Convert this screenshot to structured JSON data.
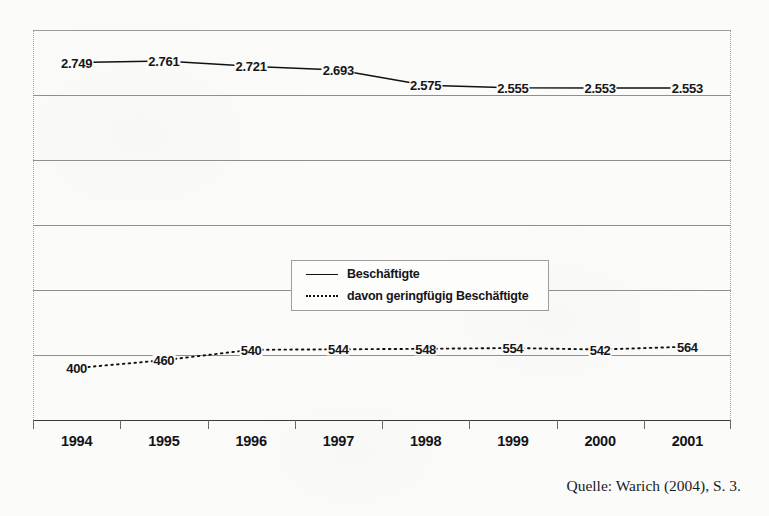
{
  "source_note": "Quelle: Warich (2004), S. 3.",
  "legend": {
    "position": "inside-center",
    "entries": [
      {
        "label": "Beschäftigte",
        "style": "solid"
      },
      {
        "label": "davon geringfügig Beschäftigte",
        "style": "dotted"
      }
    ]
  },
  "chart_data": {
    "type": "line",
    "title": "",
    "subtitle": "",
    "xlabel": "",
    "ylabel": "",
    "grid": true,
    "legend_position": "inside-center",
    "categories": [
      "1994",
      "1995",
      "1996",
      "1997",
      "1998",
      "1999",
      "2000",
      "2001"
    ],
    "series": [
      {
        "name": "Beschäftigte",
        "style": "solid",
        "color": "#111111",
        "values": [
          2749,
          2761,
          2721,
          2693,
          2575,
          2555,
          2553,
          2553
        ],
        "labels": [
          "2.749",
          "2.761",
          "2.721",
          "2.693",
          "2.575",
          "2.555",
          "2.553",
          "2.553"
        ]
      },
      {
        "name": "davon geringfügig Beschäftigte",
        "style": "dotted",
        "color": "#111111",
        "values": [
          400,
          460,
          540,
          544,
          548,
          554,
          542,
          564
        ],
        "labels": [
          "400",
          "460",
          "540",
          "544",
          "548",
          "554",
          "542",
          "564"
        ]
      }
    ],
    "ylim": [
      0,
      3000
    ],
    "gridline_values": [
      3000,
      2500,
      2000,
      1500,
      1000,
      500,
      0
    ]
  }
}
